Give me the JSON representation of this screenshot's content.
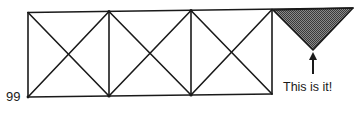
{
  "figure": {
    "page_number": "99",
    "callout_label": "This is it!",
    "stroke_color": "#1a1a1a",
    "fill_pattern_color": "#555555",
    "background_color": "#ffffff",
    "truss": {
      "panel_count": 4,
      "left_x": 28,
      "top_y": 12,
      "bottom_y": 97,
      "vertical_xs": [
        28,
        109,
        191,
        272
      ],
      "top_right_x": 353,
      "bottom_right_x": 272,
      "top_right_y": 8
    },
    "highlighted_triangle": {
      "vertices": [
        [
          273,
          10
        ],
        [
          353,
          8
        ],
        [
          313,
          50
        ]
      ],
      "fill": "crosshatch-gray"
    },
    "arrow": {
      "from": [
        313,
        73
      ],
      "to": [
        313,
        53
      ],
      "direction": "up"
    }
  }
}
